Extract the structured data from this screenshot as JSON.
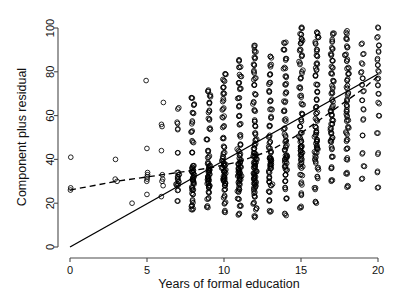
{
  "chart_data": {
    "type": "scatter",
    "title": "",
    "xlabel": "Years of formal education",
    "ylabel": "Component plus residual",
    "xlim": [
      -0.9,
      20.9
    ],
    "ylim": [
      -6,
      104
    ],
    "xticks": [
      0,
      5,
      10,
      15,
      20
    ],
    "yticks": [
      0,
      20,
      40,
      60,
      80,
      100
    ],
    "grid": false,
    "legend": null,
    "frame": "L-shaped (left and bottom axis only)",
    "point_marker": "open circle",
    "annotations": [
      "Solid straight line: component (partial-regression) line",
      "Dashed line: smoothed / loess fit"
    ],
    "lines": [
      {
        "name": "component-line",
        "style": "solid",
        "points": [
          [
            0,
            0
          ],
          [
            20,
            79
          ]
        ]
      },
      {
        "name": "smoother-line",
        "style": "dashed",
        "points": [
          [
            0,
            26
          ],
          [
            3,
            30
          ],
          [
            5,
            32
          ],
          [
            7,
            34
          ],
          [
            9,
            36
          ],
          [
            11,
            39
          ],
          [
            13,
            44
          ],
          [
            15,
            52
          ],
          [
            17,
            62
          ],
          [
            19,
            72
          ],
          [
            20,
            78
          ]
        ]
      }
    ],
    "columns": [
      {
        "x": 0,
        "n": 3,
        "values": [
          26,
          27,
          41
        ]
      },
      {
        "x": 3,
        "n": 3,
        "values": [
          30,
          31,
          40
        ]
      },
      {
        "x": 4,
        "n": 1,
        "values": [
          20
        ]
      },
      {
        "x": 5,
        "n": 8,
        "values": [
          24,
          30,
          31,
          32,
          33,
          34,
          45,
          76
        ]
      },
      {
        "x": 6,
        "n": 9,
        "values": [
          23,
          28,
          30,
          31,
          33,
          44,
          55,
          56,
          66
        ]
      },
      {
        "x": 7,
        "n": 13,
        "values": [
          21,
          26,
          28,
          29,
          30,
          31,
          32,
          33,
          34,
          43,
          54,
          57,
          63
        ]
      },
      {
        "x": 8,
        "n": 22,
        "values": [
          17,
          19,
          21,
          24,
          26,
          27,
          29,
          30,
          31,
          32,
          33,
          34,
          35,
          36,
          37,
          43,
          48,
          53,
          57,
          61,
          65,
          68
        ]
      },
      {
        "x": 9,
        "n": 24,
        "values": [
          18,
          22,
          25,
          27,
          28,
          29,
          30,
          31,
          32,
          33,
          34,
          35,
          36,
          37,
          38,
          41,
          44,
          49,
          54,
          58,
          62,
          66,
          69,
          71
        ]
      },
      {
        "x": 10,
        "n": 28,
        "values": [
          16,
          20,
          23,
          26,
          28,
          29,
          30,
          31,
          32,
          33,
          34,
          35,
          36,
          37,
          38,
          39,
          41,
          43,
          46,
          50,
          55,
          59,
          63,
          67,
          70,
          73,
          76,
          79
        ]
      },
      {
        "x": 11,
        "n": 30,
        "values": [
          15,
          19,
          22,
          25,
          27,
          29,
          30,
          31,
          32,
          33,
          34,
          35,
          36,
          37,
          38,
          39,
          40,
          42,
          44,
          47,
          51,
          56,
          60,
          64,
          68,
          72,
          75,
          78,
          82,
          85
        ]
      },
      {
        "x": 12,
        "n": 38,
        "values": [
          14,
          17,
          20,
          23,
          25,
          27,
          28,
          29,
          30,
          31,
          32,
          33,
          34,
          35,
          36,
          37,
          38,
          39,
          40,
          41,
          42,
          43,
          45,
          47,
          49,
          52,
          55,
          58,
          62,
          66,
          70,
          74,
          77,
          80,
          83,
          86,
          89,
          92
        ]
      },
      {
        "x": 13,
        "n": 26,
        "values": [
          16,
          21,
          25,
          28,
          30,
          32,
          34,
          36,
          37,
          38,
          39,
          40,
          41,
          43,
          45,
          48,
          51,
          55,
          59,
          63,
          67,
          71,
          75,
          79,
          83,
          87
        ]
      },
      {
        "x": 14,
        "n": 26,
        "values": [
          15,
          22,
          27,
          30,
          33,
          35,
          37,
          39,
          40,
          41,
          42,
          44,
          46,
          48,
          51,
          54,
          58,
          62,
          66,
          70,
          74,
          78,
          82,
          86,
          90,
          93
        ]
      },
      {
        "x": 15,
        "n": 30,
        "values": [
          18,
          24,
          29,
          33,
          36,
          38,
          40,
          42,
          43,
          44,
          45,
          46,
          48,
          50,
          52,
          55,
          58,
          61,
          65,
          69,
          73,
          77,
          80,
          84,
          87,
          90,
          93,
          95,
          97,
          100
        ]
      },
      {
        "x": 16,
        "n": 28,
        "values": [
          20,
          27,
          32,
          36,
          39,
          41,
          43,
          45,
          46,
          48,
          49,
          51,
          53,
          55,
          58,
          61,
          64,
          67,
          71,
          74,
          78,
          81,
          84,
          87,
          90,
          93,
          96,
          98
        ]
      },
      {
        "x": 17,
        "n": 24,
        "values": [
          30,
          36,
          41,
          45,
          48,
          50,
          52,
          54,
          56,
          58,
          60,
          62,
          64,
          67,
          70,
          73,
          76,
          79,
          82,
          85,
          88,
          91,
          94,
          97
        ]
      },
      {
        "x": 18,
        "n": 22,
        "values": [
          28,
          34,
          40,
          45,
          49,
          52,
          55,
          58,
          60,
          62,
          64,
          67,
          70,
          73,
          76,
          79,
          82,
          85,
          88,
          91,
          95,
          98
        ]
      },
      {
        "x": 19,
        "n": 14,
        "values": [
          31,
          37,
          43,
          51,
          58,
          63,
          67,
          71,
          74,
          77,
          80,
          84,
          88,
          93
        ]
      },
      {
        "x": 20,
        "n": 16,
        "values": [
          27,
          34,
          43,
          52,
          60,
          66,
          70,
          74,
          77,
          80,
          83,
          86,
          89,
          92,
          96,
          100
        ]
      }
    ]
  }
}
